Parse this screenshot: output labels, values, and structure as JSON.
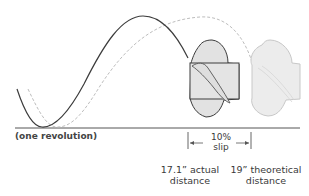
{
  "diagram": {
    "revolution_label": "(one revolution)",
    "slip": {
      "percent": "10%",
      "word": "slip"
    },
    "actual": {
      "line1": "17.1” actual",
      "line2": "distance"
    },
    "theoretical": {
      "line1": "19” theoretical",
      "line2": "distance"
    },
    "paths": {
      "actual_path": "solid dark helix curve",
      "theoretical_path": "dashed light helix curve"
    },
    "colors": {
      "solid_line": "#3c3c3c",
      "dashed_line": "#bdbdbd",
      "prop_fill": "#e2e2e2",
      "ghost_prop_fill": "#ececec",
      "ghost_prop_stroke": "#c8c8c8",
      "baseline": "#555555"
    }
  }
}
